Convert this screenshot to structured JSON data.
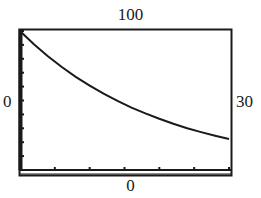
{
  "window": {
    "xmin_label": "0",
    "xmax_label": "30",
    "ymin_label": "0",
    "ymax_label": "100"
  },
  "colors": {
    "ink": "#1a1a1a",
    "background": "#ffffff"
  },
  "chart_data": {
    "type": "line",
    "title": "",
    "xlabel": "",
    "ylabel": "",
    "xlim": [
      0,
      30
    ],
    "ylim": [
      0,
      100
    ],
    "x_tick_step": 5,
    "y_tick_step": 10,
    "grid": false,
    "legend": null,
    "series": [
      {
        "name": "y = 100e^(-0.05x)",
        "x": [
          0,
          2,
          4,
          6,
          8,
          10,
          12,
          14,
          16,
          18,
          20,
          22,
          24,
          26,
          28,
          30
        ],
        "values": [
          100,
          90.5,
          81.9,
          74.1,
          67.0,
          60.7,
          54.9,
          49.7,
          44.9,
          40.7,
          36.8,
          33.3,
          30.1,
          27.3,
          24.7,
          22.3
        ]
      }
    ]
  }
}
